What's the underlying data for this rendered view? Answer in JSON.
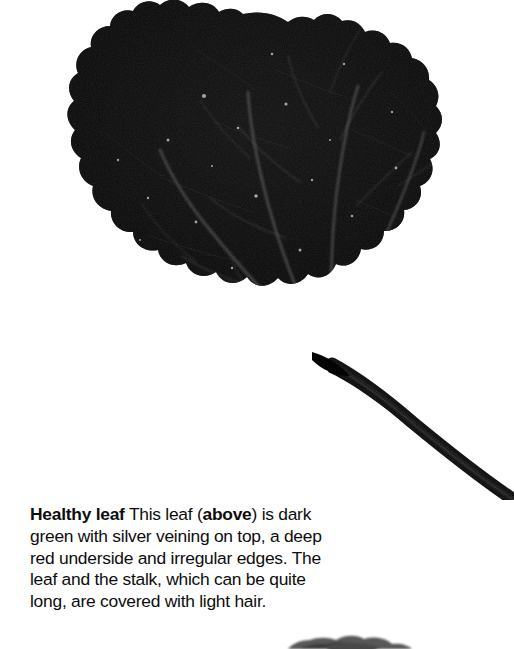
{
  "page": {
    "background_color": "#ffffff",
    "text_color": "#0d0d0d",
    "width": 514,
    "height": 649
  },
  "figure": {
    "name": "healthy-leaf-photograph",
    "subject": "leaf",
    "leaf_color": "#0a0a0a",
    "vein_color": "#5a5a5a",
    "background_color": "#ffffff"
  },
  "caption": {
    "lead_in": "Healthy leaf",
    "text_part_1": " This leaf (",
    "emphasis": "above",
    "text_part_2": ") is dark green with silver veining on top, a deep red underside and irregular edges. The leaf and the stalk, which can be quite long, are covered with light hair."
  },
  "next_figure": {
    "name": "partial-figure-below",
    "description": "Top sliver of the next photograph, cropped by the page edge"
  }
}
